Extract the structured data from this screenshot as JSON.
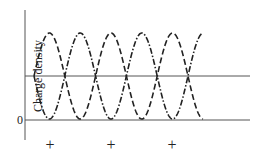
{
  "diagram": {
    "y_axis_label": "Charge density",
    "zero_label": "0",
    "plus_markers": [
      "+",
      "+",
      "+"
    ],
    "plus_positions_x": [
      50,
      111,
      172
    ],
    "line_color": "#222222",
    "waves": [
      {
        "name": "wave-dashed",
        "style": "dashed",
        "phase": "starts rising"
      },
      {
        "name": "wave-dash-dot",
        "style": "dash-dot",
        "phase": "starts falling"
      }
    ],
    "cycles": 6
  }
}
